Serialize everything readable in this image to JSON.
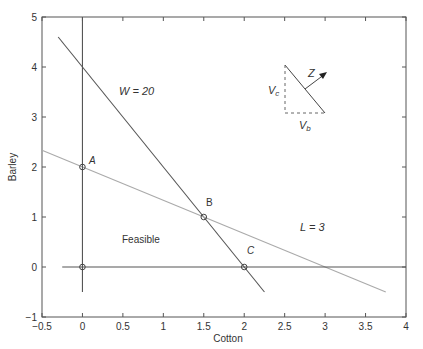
{
  "chart_data": {
    "type": "line",
    "title": "",
    "xlabel": "Cotton",
    "ylabel": "Barley",
    "xlim": [
      -0.5,
      4
    ],
    "ylim": [
      -1,
      5
    ],
    "grid": false,
    "xticks": [
      "-0.5",
      "0",
      "0.5",
      "1",
      "1.5",
      "2",
      "2.5",
      "3",
      "3.5",
      "4"
    ],
    "yticks": [
      "-1",
      "0",
      "1",
      "2",
      "3",
      "4",
      "5"
    ],
    "series": [
      {
        "name": "W = 20",
        "x": [
          -0.3,
          2.25
        ],
        "y": [
          4.6,
          -0.5
        ],
        "color": "#555555"
      },
      {
        "name": "L = 3",
        "x": [
          -0.5,
          3.75
        ],
        "y": [
          2.333,
          -0.5
        ],
        "color": "#aaaaaa"
      },
      {
        "name": "Cotton = 0",
        "x": [
          0,
          0
        ],
        "y": [
          5,
          -0.5
        ],
        "color": "#555555"
      },
      {
        "name": "Barley = 0",
        "x": [
          -0.25,
          4
        ],
        "y": [
          0,
          0
        ],
        "color": "#555555"
      }
    ],
    "points": [
      {
        "label": "A",
        "x": 0,
        "y": 2
      },
      {
        "label": "B",
        "x": 1.5,
        "y": 1
      },
      {
        "label": "C",
        "x": 2,
        "y": 0
      },
      {
        "label": "",
        "x": 0,
        "y": 0
      }
    ],
    "annotations": [
      {
        "text": "W = 20",
        "x": 0.65,
        "y": 3.95
      },
      {
        "text": "L = 3",
        "x": 2.55,
        "y": 0.75
      },
      {
        "text": "Feasible",
        "x": 0.65,
        "y": 0.45
      }
    ],
    "inset": {
      "objective_label": "Z",
      "vertical_label": "Vc",
      "horizontal_label": "Vb"
    }
  },
  "labels": {
    "w": "W = 20",
    "l": "L = 3",
    "feasible": "Feasible",
    "a": "A",
    "b": "B",
    "c": "C",
    "z": "Z",
    "vc_main": "V",
    "vc_sub": "c",
    "vb_main": "V",
    "vb_sub": "b",
    "xlabel": "Cotton",
    "ylabel": "Barley"
  }
}
